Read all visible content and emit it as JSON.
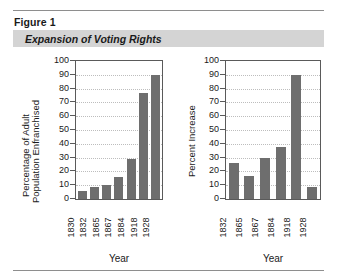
{
  "figure": {
    "label": "Figure 1",
    "title": "Expansion of Voting Rights",
    "band_color": "#d4d4d4",
    "bar_color": "#6e6e6e"
  },
  "chart_data": [
    {
      "id": "left",
      "type": "bar",
      "title": "",
      "xlabel": "Year",
      "ylabel": "Percentage of Adult Population Enfranchised",
      "ylabel_line1": "Percentage of Adult",
      "ylabel_line2": "Population Enfranchised",
      "categories": [
        "1830",
        "1832",
        "1865",
        "1867",
        "1884",
        "1918",
        "1928"
      ],
      "values": [
        6,
        9,
        10.5,
        16,
        29,
        77,
        90
      ],
      "ylim": [
        0,
        100
      ],
      "yticks": [
        0,
        10,
        20,
        30,
        40,
        50,
        60,
        70,
        80,
        90,
        100
      ],
      "ytick_labels": [
        "0",
        "10",
        "20",
        "30",
        "40",
        "50",
        "60",
        "70",
        "80",
        "90",
        "100"
      ],
      "grid": true,
      "legend": "none"
    },
    {
      "id": "right",
      "type": "bar",
      "title": "",
      "xlabel": "Year",
      "ylabel": "Percent Increase",
      "categories": [
        "1832",
        "1865",
        "1867",
        "1884",
        "1918",
        "1928"
      ],
      "values": [
        26,
        17,
        30,
        38,
        90,
        8.5
      ],
      "ylim": [
        0,
        100
      ],
      "yticks": [
        0,
        10,
        20,
        30,
        40,
        50,
        60,
        70,
        80,
        90,
        100
      ],
      "ytick_labels": [
        "0",
        "10",
        "20",
        "30",
        "40",
        "50",
        "60",
        "70",
        "80",
        "90",
        "100"
      ],
      "grid": true,
      "legend": "none"
    }
  ]
}
